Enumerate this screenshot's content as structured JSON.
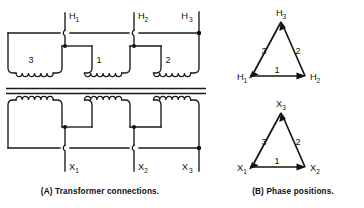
{
  "figure": {
    "background_color": "#ffffff",
    "line_color": "#1a1a1a"
  },
  "panel_a": {
    "caption": "(A) Transformer connections.",
    "primary_terminals": [
      {
        "name": "H1",
        "base": "H",
        "sub": "1"
      },
      {
        "name": "H2",
        "base": "H",
        "sub": "2"
      },
      {
        "name": "H3",
        "base": "H",
        "sub": "3"
      }
    ],
    "secondary_terminals": [
      {
        "name": "X1",
        "base": "X",
        "sub": "1"
      },
      {
        "name": "X2",
        "base": "X",
        "sub": "2"
      },
      {
        "name": "X3",
        "base": "X",
        "sub": "3"
      }
    ],
    "primary_windings": [
      {
        "label": "3"
      },
      {
        "label": "1"
      },
      {
        "label": "2"
      }
    ],
    "secondary_windings": [
      {
        "label": ""
      },
      {
        "label": ""
      },
      {
        "label": ""
      }
    ]
  },
  "panel_b": {
    "caption": "(B) Phase positions.",
    "diagrams": [
      {
        "id": "primary-phase-triangle",
        "vertices": [
          {
            "name": "H1",
            "base": "H",
            "sub": "1"
          },
          {
            "name": "H2",
            "base": "H",
            "sub": "2"
          },
          {
            "name": "H3",
            "base": "H",
            "sub": "3"
          }
        ],
        "sides": [
          {
            "label": "1",
            "from": "H1",
            "to": "H2"
          },
          {
            "label": "2",
            "from": "H2",
            "to": "H3"
          },
          {
            "label": "3",
            "from": "H3",
            "to": "H1"
          }
        ]
      },
      {
        "id": "secondary-phase-triangle",
        "vertices": [
          {
            "name": "X1",
            "base": "X",
            "sub": "1"
          },
          {
            "name": "X2",
            "base": "X",
            "sub": "2"
          },
          {
            "name": "X3",
            "base": "X",
            "sub": "3"
          }
        ],
        "sides": [
          {
            "label": "1",
            "from": "X1",
            "to": "X2"
          },
          {
            "label": "2",
            "from": "X2",
            "to": "X3"
          },
          {
            "label": "3",
            "from": "X3",
            "to": "X1"
          }
        ]
      }
    ]
  }
}
